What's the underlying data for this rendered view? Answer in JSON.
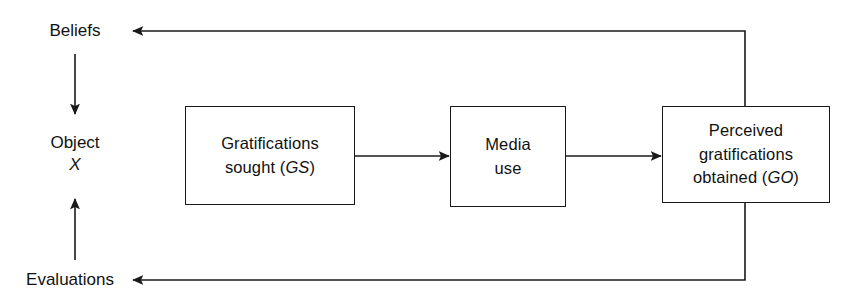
{
  "diagram": {
    "type": "flow-diagram",
    "colors": {
      "background": "#ffffff",
      "stroke": "#1a1a1a",
      "text": "#111111"
    },
    "left_column": {
      "beliefs_label": "Beliefs",
      "object_label": "Object",
      "object_variable": "X",
      "evaluations_label": "Evaluations"
    },
    "boxes": [
      {
        "id": "gratifications-sought",
        "lines": [
          "Gratifications",
          "sought (GS)"
        ],
        "line1": "Gratifications",
        "line2_text": "sought (",
        "line2_italic": "GS",
        "line2_tail": ")"
      },
      {
        "id": "media-use",
        "lines": [
          "Media",
          "use"
        ],
        "line1": "Media",
        "line2": "use"
      },
      {
        "id": "perceived-gratifications-obtained",
        "lines": [
          "Perceived",
          "gratifications",
          "obtained (GO)"
        ],
        "line1": "Perceived",
        "line2": "gratifications",
        "line3_text": "obtained (",
        "line3_italic": "GO",
        "line3_tail": ")"
      }
    ],
    "connectors": [
      {
        "id": "beliefs-to-object",
        "from": "Beliefs",
        "to": "Object X",
        "direction": "down"
      },
      {
        "id": "evaluations-to-object",
        "from": "Evaluations",
        "to": "Object X",
        "direction": "up"
      },
      {
        "id": "gs-to-media-use",
        "from": "Gratifications sought (GS)",
        "to": "Media use",
        "direction": "right"
      },
      {
        "id": "media-use-to-go",
        "from": "Media use",
        "to": "Perceived gratifications obtained (GO)",
        "direction": "right"
      },
      {
        "id": "go-feedback-to-beliefs",
        "from": "Perceived gratifications obtained (GO)",
        "to": "Beliefs",
        "direction": "left"
      },
      {
        "id": "go-feedback-to-evaluations",
        "from": "Perceived gratifications obtained (GO)",
        "to": "Evaluations",
        "direction": "left"
      }
    ]
  }
}
